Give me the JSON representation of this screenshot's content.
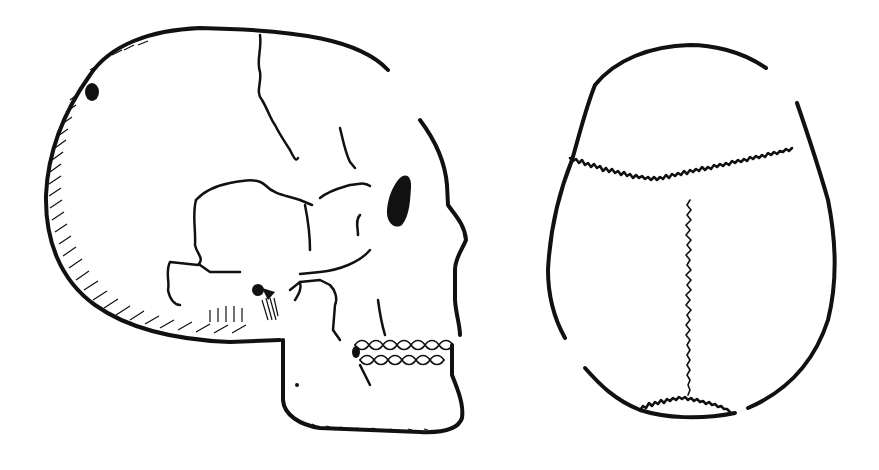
{
  "figure": {
    "background": "#ffffff",
    "ink_color": "#111111",
    "panels": [
      {
        "id": "lateral",
        "label": "",
        "description": "Side (lateral) view of a human skull with cranial sutures, orbit, zygomatic arch, mandible and teeth"
      },
      {
        "id": "superior",
        "label": "",
        "description": "Top (superior) view of a skull showing coronal, sagittal and lambdoid sutures"
      }
    ]
  }
}
